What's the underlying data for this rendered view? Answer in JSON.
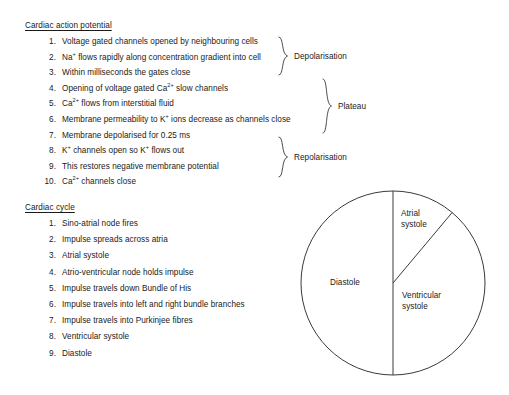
{
  "document": {
    "sections": [
      {
        "id": "cardiac-action-potential",
        "heading": "Cardiac action potential",
        "items": [
          {
            "index": "1.",
            "text_html": "Voltage gated channels opened by neighbouring cells",
            "text": "Voltage gated channels opened by neighbouring cells"
          },
          {
            "index": "2.",
            "text_html": "Na<sup>+</sup> flows rapidly along concentration gradient into cell",
            "text": "Na+ flows rapidly along concentration gradient into cell"
          },
          {
            "index": "3.",
            "text_html": "Within milliseconds the gates close",
            "text": "Within milliseconds the gates close"
          },
          {
            "index": "4.",
            "text_html": "Opening of voltage gated Ca<sup>2+</sup> slow channels",
            "text": "Opening of voltage gated Ca2+ slow channels"
          },
          {
            "index": "5.",
            "text_html": "Ca<sup>2+</sup> flows from interstitial fluid",
            "text": "Ca2+ flows from interstitial fluid"
          },
          {
            "index": "6.",
            "text_html": "Membrane permeability to K<sup>+</sup> ions decrease as channels close",
            "text": "Membrane permeability to K+ ions decrease as channels close"
          },
          {
            "index": "7.",
            "text_html": "Membrane depolarised for 0.25 ms",
            "text": "Membrane depolarised for 0.25 ms"
          },
          {
            "index": "8.",
            "text_html": "K<sup>+</sup> channels open so K<sup>+</sup> flows out",
            "text": "K+ channels open so K+ flows out"
          },
          {
            "index": "9.",
            "text_html": "This restores negative membrane potential",
            "text": "This restores negative membrane potential"
          },
          {
            "index": "10.",
            "text_html": "Ca<sup>2+</sup> channels close",
            "text": "Ca2+ channels close"
          }
        ],
        "phase_braces": [
          {
            "label": "Depolarisation",
            "covers_items": [
              "1",
              "2",
              "3"
            ]
          },
          {
            "label": "Plateau",
            "covers_items": [
              "4",
              "5",
              "6",
              "7"
            ]
          },
          {
            "label": "Repolarisation",
            "covers_items": [
              "8",
              "9",
              "10"
            ]
          }
        ]
      },
      {
        "id": "cardiac-cycle",
        "heading": "Cardiac cycle",
        "items": [
          {
            "index": "1.",
            "text_html": "Sino-atrial node fires",
            "text": "Sino-atrial node fires"
          },
          {
            "index": "2.",
            "text_html": "Impulse spreads across atria",
            "text": "Impulse spreads across atria"
          },
          {
            "index": "3.",
            "text_html": "Atrial systole",
            "text": "Atrial systole"
          },
          {
            "index": "4.",
            "text_html": "Atrio-ventricular node holds impulse",
            "text": "Atrio-ventricular node holds impulse"
          },
          {
            "index": "5.",
            "text_html": "Impulse travels down Bundle of His",
            "text": "Impulse travels down Bundle of His"
          },
          {
            "index": "6.",
            "text_html": "Impulse travels into left and right bundle branches",
            "text": "Impulse travels into left and right bundle branches"
          },
          {
            "index": "7.",
            "text_html": "Impulse travels into Purkinjee fibres",
            "text": "Impulse travels into Purkinjee fibres"
          },
          {
            "index": "8.",
            "text_html": "Ventricular systole",
            "text": "Ventricular systole"
          },
          {
            "index": "9.",
            "text_html": "Diastole",
            "text": "Diastole"
          }
        ]
      }
    ]
  },
  "chart_data": {
    "type": "pie",
    "title": "",
    "categories": [
      "Atrial systole",
      "Ventricular systole",
      "Diastole"
    ],
    "values": [
      11,
      39,
      50
    ],
    "unit": "percent of cardiac cycle",
    "labels": {
      "atrial": "Atrial systole",
      "ventricular": "Ventricular systole",
      "diastole": "Diastole"
    },
    "legend": "none",
    "label_placement": "inside-slice",
    "slice_style": {
      "fill": "#ffffff",
      "stroke": "#3a3a3a",
      "stroke_width": 1
    },
    "start_angle_deg": 0,
    "geometry": {
      "center_x": 393,
      "center_y": 283,
      "radius": 92
    },
    "slice_boundaries_deg_from_top_clockwise": [
      0,
      40,
      180,
      360
    ]
  },
  "colors": {
    "background": "#ffffff",
    "text": "#1a1a1a",
    "stroke": "#3a3a3a"
  }
}
